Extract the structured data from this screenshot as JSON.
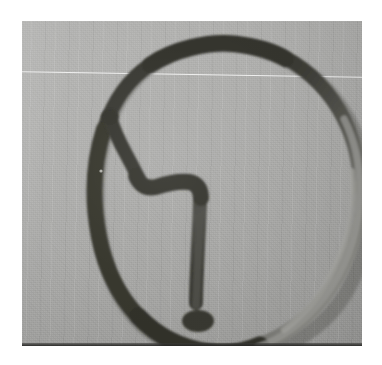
{
  "image": {
    "kind": "photograph",
    "subject": "hand-drawn circle divided by a stepped interior line",
    "caption": "",
    "border_color": "#ffffff",
    "surface_color": "#aeaeac",
    "ink_color": "#3a3a38",
    "faded_ink_color": "#7d7d7b",
    "border": {
      "left": 22,
      "top": 21,
      "width": 340,
      "height": 325
    }
  },
  "drawing": {
    "outer_circle": {
      "name": "hand-drawn-circle",
      "stroke_width_dark": 15,
      "stroke_width_faded": 7,
      "path": "M 248 30 C 210 14, 160 20, 126 45 C 96 68, 78 104, 74 152 C 70 200, 80 252, 104 286 C 128 320, 172 336, 214 334 C 258 332, 302 306, 324 266 C 346 226, 350 174, 338 130 C 326 86, 296 50, 248 30 Z"
    },
    "interior_step_line": {
      "name": "stepped-interior-line",
      "stroke_width": 14,
      "path": "M 84 95 L 96 121 L 104 152 L 112 170 L 128 165 L 160 163 L 175 168 L 178 185 L 176 230 L 175 275 L 176 288"
    },
    "annotations": {
      "top_arc_label": "",
      "interior_label": ""
    }
  },
  "colors": {
    "paper_white": "#ffffff",
    "photo_gray_light": "#b6b6b4",
    "photo_gray_dark": "#a0a09e",
    "ink_dark": "#36362f",
    "ink_mid": "#4a4a44",
    "ink_faded": "#8a8a86",
    "bottom_edge": "#2c2c2a"
  }
}
